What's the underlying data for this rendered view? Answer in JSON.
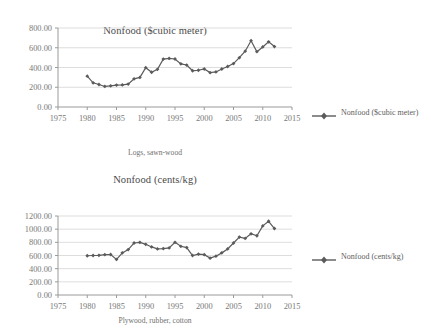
{
  "charts": [
    {
      "id": "chart-1",
      "title": "Nonfood ($cubic meter)",
      "xlabel": "Logs, sawn-wood",
      "legend_label": "Nonfood ($cubic meter)",
      "series_color": "#5b5b5b",
      "yticks": [
        "0.00",
        "200.00",
        "400.00",
        "600.00",
        "800.00"
      ],
      "xticks": [
        "1975",
        "1980",
        "1985",
        "1990",
        "1995",
        "2000",
        "2005",
        "2010",
        "2015"
      ]
    },
    {
      "id": "chart-2",
      "title": "Nonfood (cents/kg)",
      "xlabel": "Plywood, rubber, cotton",
      "legend_label": "Nonfood (cents/kg)",
      "series_color": "#5b5b5b",
      "yticks": [
        "0.00",
        "200.00",
        "400.00",
        "600.00",
        "800.00",
        "1000.00",
        "1200.00"
      ],
      "xticks": [
        "1975",
        "1980",
        "1985",
        "1990",
        "1995",
        "2000",
        "2005",
        "2010",
        "2015"
      ]
    }
  ],
  "chart_data": [
    {
      "type": "line",
      "title": "Nonfood ($cubic meter)",
      "xlabel": "Logs, sawn-wood",
      "ylabel": "",
      "series_name": "Nonfood ($cubic meter)",
      "xlim": [
        1975,
        2015
      ],
      "ylim": [
        0,
        800
      ],
      "ytick_values": [
        0,
        200,
        400,
        600,
        800
      ],
      "xtick_values": [
        1975,
        1980,
        1985,
        1990,
        1995,
        2000,
        2005,
        2010,
        2015
      ],
      "grid": "horizontal",
      "legend_position": "right",
      "marker": "diamond",
      "x": [
        1980,
        1981,
        1982,
        1983,
        1984,
        1985,
        1986,
        1987,
        1988,
        1989,
        1990,
        1991,
        1992,
        1993,
        1994,
        1995,
        1996,
        1997,
        1998,
        1999,
        2000,
        2001,
        2002,
        2003,
        2004,
        2005,
        2006,
        2007,
        2008,
        2009,
        2010,
        2011,
        2012
      ],
      "values": [
        312,
        245,
        228,
        208,
        214,
        222,
        224,
        232,
        285,
        300,
        398,
        352,
        382,
        485,
        492,
        486,
        437,
        425,
        367,
        372,
        385,
        348,
        355,
        385,
        410,
        440,
        500,
        565,
        672,
        560,
        608,
        660,
        612
      ]
    },
    {
      "type": "line",
      "title": "Nonfood (cents/kg)",
      "xlabel": "Plywood, rubber, cotton",
      "ylabel": "",
      "series_name": "Nonfood (cents/kg)",
      "xlim": [
        1975,
        2015
      ],
      "ylim": [
        0,
        1200
      ],
      "ytick_values": [
        0,
        200,
        400,
        600,
        800,
        1000,
        1200
      ],
      "xtick_values": [
        1975,
        1980,
        1985,
        1990,
        1995,
        2000,
        2005,
        2010,
        2015
      ],
      "grid": "horizontal",
      "legend_position": "right",
      "marker": "diamond",
      "x": [
        1980,
        1981,
        1982,
        1983,
        1984,
        1985,
        1986,
        1987,
        1988,
        1989,
        1990,
        1991,
        1992,
        1993,
        1994,
        1995,
        1996,
        1997,
        1998,
        1999,
        2000,
        2001,
        2002,
        2003,
        2004,
        2005,
        2006,
        2007,
        2008,
        2009,
        2010,
        2011,
        2012
      ],
      "values": [
        596,
        600,
        602,
        612,
        615,
        540,
        640,
        690,
        790,
        800,
        770,
        730,
        700,
        705,
        715,
        800,
        740,
        720,
        600,
        620,
        612,
        560,
        590,
        640,
        700,
        790,
        880,
        860,
        930,
        900,
        1050,
        1120,
        1010
      ]
    }
  ]
}
